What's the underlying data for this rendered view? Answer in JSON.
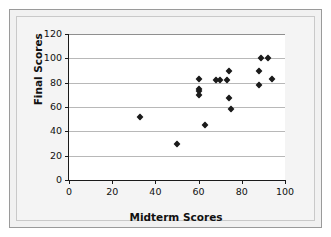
{
  "chart_data": {
    "type": "scatter",
    "title": "",
    "xlabel": "Midterm Scores",
    "ylabel": "Final Scores",
    "xlim": [
      0,
      100
    ],
    "ylim": [
      0,
      120
    ],
    "xticks": [
      0,
      20,
      40,
      60,
      80,
      100
    ],
    "yticks": [
      0,
      20,
      40,
      60,
      80,
      100,
      120
    ],
    "xtick_labels": [
      "0",
      "20",
      "40",
      "60",
      "80",
      "100"
    ],
    "ytick_labels": [
      "0",
      "20",
      "40",
      "60",
      "80",
      "100",
      "120"
    ],
    "grid": "horizontal",
    "legend": "none",
    "marker": "diamond",
    "marker_color": "#1b1b1b",
    "points": [
      {
        "x": 33,
        "y": 52
      },
      {
        "x": 50,
        "y": 30
      },
      {
        "x": 60,
        "y": 83
      },
      {
        "x": 60,
        "y": 75
      },
      {
        "x": 60,
        "y": 73
      },
      {
        "x": 60,
        "y": 70
      },
      {
        "x": 63,
        "y": 45
      },
      {
        "x": 68,
        "y": 82
      },
      {
        "x": 70,
        "y": 82
      },
      {
        "x": 73,
        "y": 82
      },
      {
        "x": 74,
        "y": 90
      },
      {
        "x": 74,
        "y": 67
      },
      {
        "x": 75,
        "y": 58
      },
      {
        "x": 88,
        "y": 90
      },
      {
        "x": 88,
        "y": 78
      },
      {
        "x": 89,
        "y": 100
      },
      {
        "x": 92,
        "y": 100
      },
      {
        "x": 94,
        "y": 83
      }
    ]
  },
  "axes": {
    "x_title": "Midterm Scores",
    "y_title": "Final Scores"
  }
}
